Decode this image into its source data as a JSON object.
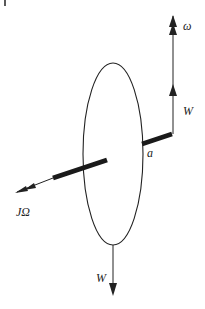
{
  "diagram": {
    "type": "gyroscope-precession-free-body",
    "labels": {
      "omega": "ω",
      "weight_top": "W",
      "weight_bottom": "W",
      "angular_momentum": "JΩ",
      "distance": "a"
    },
    "colors": {
      "line": "#222222",
      "axle": "#1a1a1a",
      "background": "#ffffff"
    }
  }
}
